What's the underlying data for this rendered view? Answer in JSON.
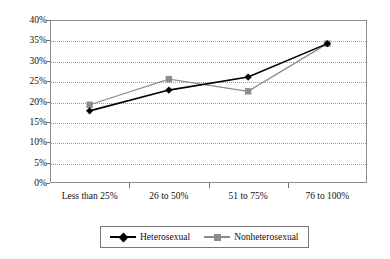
{
  "chart_data": {
    "type": "line",
    "title": "",
    "xlabel": "",
    "ylabel": "",
    "categories": [
      "Less than 25%",
      "26 to 50%",
      "51 to 75%",
      "76 to 100%"
    ],
    "series": [
      {
        "name": "Heterosexual",
        "values": [
          17.7,
          22.8,
          26.0,
          34.2
        ],
        "color": "#000000",
        "marker": "diamond"
      },
      {
        "name": "Nonheterosexual",
        "values": [
          19.2,
          25.5,
          22.5,
          34.2
        ],
        "color": "#8c8c8c",
        "marker": "square"
      }
    ],
    "ylim": [
      0,
      40
    ],
    "ytick_values": [
      0,
      5,
      10,
      15,
      20,
      25,
      30,
      35,
      40
    ],
    "ytick_labels": [
      "0%",
      "5%",
      "10%",
      "15%",
      "20%",
      "25%",
      "30%",
      "35%",
      "40%"
    ],
    "grid": true,
    "grid_style": "dotted-horizontal",
    "legend_position": "bottom-center"
  },
  "legend": {
    "entries": [
      {
        "label": "Heterosexual"
      },
      {
        "label": "Nonheterosexual"
      }
    ]
  }
}
